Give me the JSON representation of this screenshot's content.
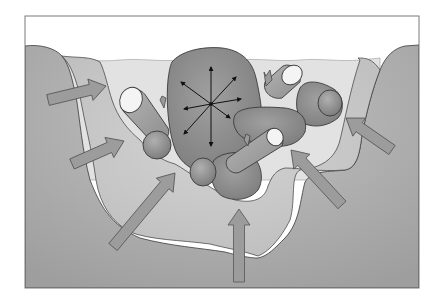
{
  "figure": {
    "width": 441,
    "height": 305,
    "frame": {
      "x": 25,
      "y": 16,
      "w": 394,
      "h": 272
    }
  },
  "colors": {
    "background": "#ffffff",
    "frame_stroke": "#7a7a7a",
    "sky": "#ffffff",
    "water": "#e2e2e2",
    "ground_outer": "#a9a9a9",
    "ground_inner": "#cbcbcb",
    "mass_dark": "#8a8a8a",
    "mass_mid": "#9a9a9a",
    "log_body": "#a4a4a4",
    "log_end": "#f4f4f4",
    "arrow_fill": "#9c9c9c",
    "arrow_stroke": "#555555",
    "outline": "#3a3a3a",
    "radial_arrow": "#111111"
  },
  "shapes": {
    "central_mass": {
      "label": "central-mass"
    },
    "right_upper_mass": {
      "label": "right-upper-mass"
    },
    "right_lower_mass": {
      "label": "right-lower-mass"
    },
    "logs": [
      {
        "label": "left-log",
        "end_cx": 134,
        "end_cy": 102,
        "end_rx": 14,
        "end_ry": 12
      },
      {
        "label": "right-top-log",
        "end_cx": 292,
        "end_cy": 75,
        "end_rx": 13,
        "end_ry": 11
      },
      {
        "label": "middle-log",
        "end_cx": 275,
        "end_cy": 137,
        "end_rx": 9,
        "end_ry": 9
      }
    ],
    "knobs": [
      {
        "label": "left-knob",
        "cx": 157,
        "cy": 145,
        "rx": 14,
        "ry": 14
      },
      {
        "label": "bottom-knob",
        "cx": 203,
        "cy": 172,
        "rx": 13,
        "ry": 14
      },
      {
        "label": "right-knob",
        "cx": 330,
        "cy": 103,
        "rx": 12,
        "ry": 13
      }
    ]
  },
  "radial_arrows": {
    "center": {
      "x": 211,
      "y": 104
    },
    "count": 8,
    "tips": [
      {
        "x": 211,
        "y": 67
      },
      {
        "x": 236,
        "y": 77
      },
      {
        "x": 241,
        "y": 99
      },
      {
        "x": 230,
        "y": 118
      },
      {
        "x": 211,
        "y": 146
      },
      {
        "x": 184,
        "y": 134
      },
      {
        "x": 184,
        "y": 109
      },
      {
        "x": 181,
        "y": 82
      }
    ]
  },
  "inward_arrows": [
    {
      "label": "arrow-left-upper",
      "from": {
        "x": 48,
        "y": 100
      },
      "to": {
        "x": 106,
        "y": 86
      }
    },
    {
      "label": "arrow-left-middle",
      "from": {
        "x": 72,
        "y": 164
      },
      "to": {
        "x": 124,
        "y": 141
      }
    },
    {
      "label": "arrow-lower-left",
      "from": {
        "x": 113,
        "y": 247
      },
      "to": {
        "x": 175,
        "y": 173
      }
    },
    {
      "label": "arrow-bottom-center",
      "from": {
        "x": 239,
        "y": 282
      },
      "to": {
        "x": 239,
        "y": 209
      }
    },
    {
      "label": "arrow-lower-right",
      "from": {
        "x": 342,
        "y": 205
      },
      "to": {
        "x": 291,
        "y": 150
      }
    },
    {
      "label": "arrow-right",
      "from": {
        "x": 392,
        "y": 150
      },
      "to": {
        "x": 346,
        "y": 118
      }
    }
  ]
}
